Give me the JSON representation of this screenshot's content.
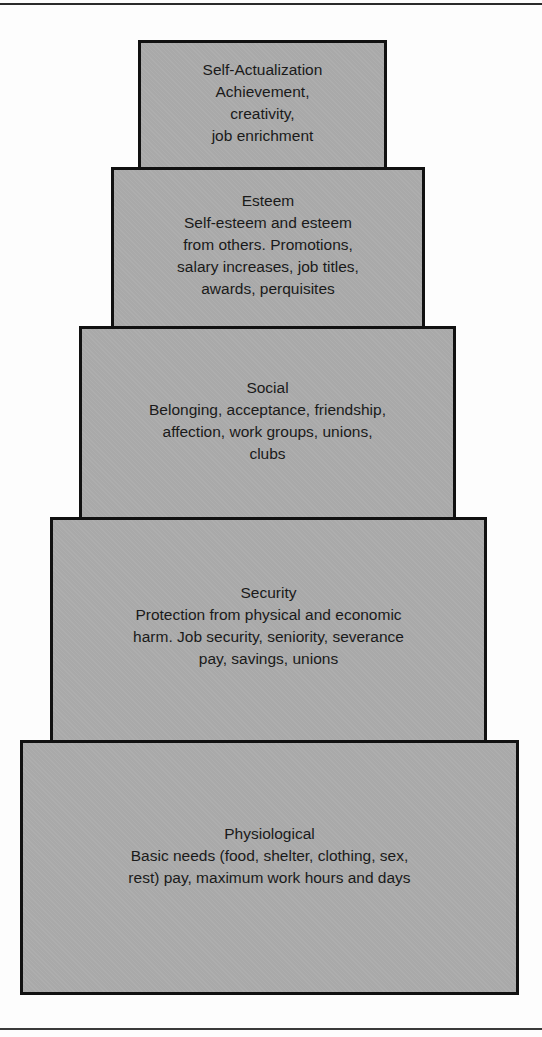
{
  "diagram": {
    "type": "pyramid",
    "title": "",
    "tiers": [
      {
        "level": 5,
        "title": "Self-Actualization",
        "description": "Achievement,\ncreativity,\njob enrichment"
      },
      {
        "level": 4,
        "title": "Esteem",
        "description": "Self-esteem and esteem\nfrom others. Promotions,\nsalary increases, job titles,\nawards, perquisites"
      },
      {
        "level": 3,
        "title": "Social",
        "description": "Belonging, acceptance, friendship,\naffection, work groups, unions,\nclubs"
      },
      {
        "level": 2,
        "title": "Security",
        "description": "Protection from physical and economic\nharm. Job security, seniority, severance\npay, savings, unions"
      },
      {
        "level": 1,
        "title": "Physiological",
        "description": "Basic needs (food, shelter, clothing, sex,\nrest) pay, maximum work hours and days"
      }
    ],
    "colors": {
      "tier_fill": "#a9a9a9",
      "tier_border": "#111111",
      "background": "#fdfdfd"
    }
  }
}
